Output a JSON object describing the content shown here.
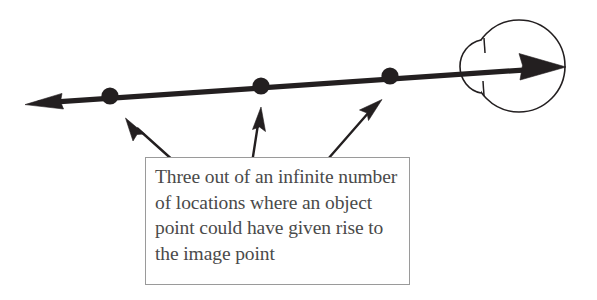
{
  "figure": {
    "title": "Three out of an infinite number of locations where an object point could have given rise to the image point",
    "background_color": "#ffffff",
    "ink_color": "#231f20",
    "box_border_color": "#9a9a9a",
    "text_color": "#4a4a4a"
  },
  "caption": {
    "lines": [
      "Three out of an infinite number",
      "of locations where an object",
      "point could have given rise to",
      "the image point"
    ]
  },
  "diagram": {
    "sight_line": {
      "label": "line-of-sight-double-arrow",
      "left_tip": {
        "x": 25,
        "y": 104
      },
      "right_tip": {
        "x": 566,
        "y": 67
      },
      "thickness": 5
    },
    "object_points": [
      {
        "label": "object-point-near",
        "x": 110,
        "y": 96,
        "radius": 8.5
      },
      {
        "label": "object-point-middle",
        "x": 261,
        "y": 86,
        "radius": 8.5
      },
      {
        "label": "object-point-far",
        "x": 390,
        "y": 76,
        "radius": 8.5
      }
    ],
    "eye": {
      "label": "eye-globe",
      "center": {
        "x": 519,
        "y": 66
      },
      "radius": 46,
      "cornea_label": "cornea-bulge"
    },
    "pointers": [
      {
        "label": "pointer-to-near-point",
        "from": {
          "x": 175,
          "y": 162
        },
        "to": {
          "x": 126,
          "y": 118
        }
      },
      {
        "label": "pointer-to-middle-point",
        "from": {
          "x": 254,
          "y": 161
        },
        "to": {
          "x": 261,
          "y": 107
        }
      },
      {
        "label": "pointer-to-far-point",
        "from": {
          "x": 329,
          "y": 158
        },
        "to": {
          "x": 382,
          "y": 100
        }
      }
    ]
  }
}
